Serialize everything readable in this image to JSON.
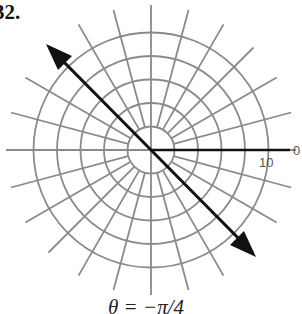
{
  "problem": {
    "number": "32."
  },
  "diagram": {
    "type": "polar-grid",
    "center": [
      151,
      150
    ],
    "circle_count": 5,
    "circle_step_px": 23.5,
    "ray_count": 24,
    "ray_step_deg": 15,
    "ray_length_px": 145,
    "grid_color": "#8a8a8a",
    "line_color": "#111111",
    "radius_label": "10",
    "angle_label": "0",
    "graphed_line": {
      "angle": "-π/4",
      "arrows": "both"
    }
  },
  "caption": {
    "text": "θ = −π/4"
  }
}
